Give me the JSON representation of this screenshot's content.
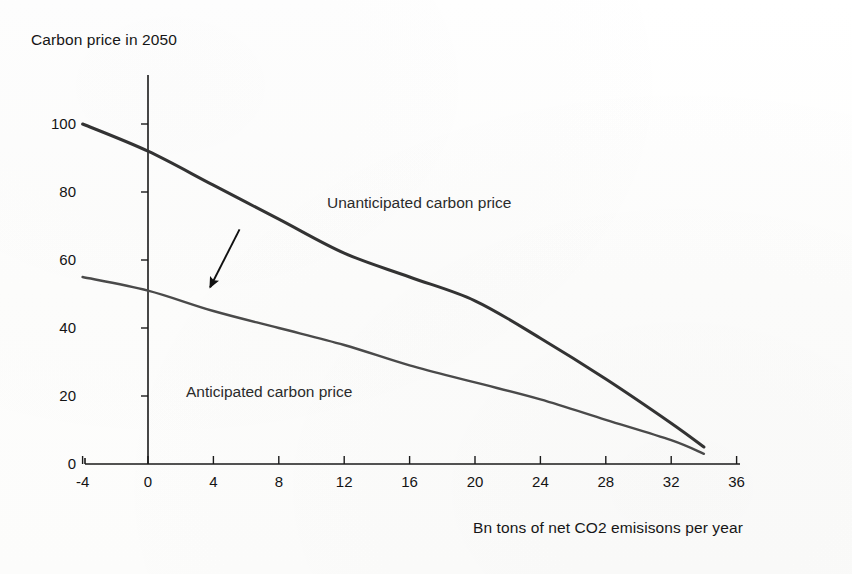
{
  "chart_data": {
    "type": "line",
    "title": "",
    "ylabel": "Carbon price in 2050",
    "xlabel": "Bn tons of net CO2 emisisons per year",
    "xlim": [
      -6,
      37
    ],
    "ylim": [
      0,
      108
    ],
    "xticks": [
      -4,
      0,
      4,
      8,
      12,
      16,
      20,
      24,
      28,
      32,
      36
    ],
    "xtick_labels": [
      "-4",
      "0",
      "4",
      "8",
      "12",
      "16",
      "20",
      "24",
      "28",
      "32",
      "36"
    ],
    "yticks": [
      0,
      20,
      40,
      60,
      80,
      100
    ],
    "ytick_labels": [
      "0",
      "20",
      "40",
      "60",
      "80",
      "100"
    ],
    "grid": false,
    "legend_position": "inline-annotations",
    "series": [
      {
        "name": "Unanticipated carbon price",
        "color": "#333333",
        "label_x": 10,
        "label_y": 77,
        "x": [
          -4,
          0,
          4,
          8,
          12,
          16,
          20,
          24,
          28,
          32,
          34
        ],
        "values": [
          100,
          92,
          82,
          72,
          62,
          55,
          48,
          37,
          25,
          12,
          5
        ]
      },
      {
        "name": "Anticipated carbon price",
        "color": "#4a4a4a",
        "label_x": 1,
        "label_y": 22,
        "x": [
          -4,
          0,
          4,
          8,
          12,
          16,
          20,
          24,
          28,
          32,
          34
        ],
        "values": [
          55,
          51,
          45,
          40,
          35,
          29,
          24,
          19,
          13,
          7,
          3
        ]
      }
    ],
    "annotations": [
      {
        "name": "downward-shift-arrow",
        "type": "arrow",
        "from_x": 5.6,
        "from_y": 69,
        "to_x": 3.8,
        "to_y": 52
      }
    ]
  },
  "axes": {
    "y_axis_title": "Carbon price in 2050",
    "x_axis_title": "Bn tons of net CO2 emisisons per year"
  },
  "labels": {
    "unanticipated": "Unanticipated carbon price",
    "anticipated": "Anticipated carbon price"
  },
  "ticks": {
    "x": [
      "-4",
      "0",
      "4",
      "8",
      "12",
      "16",
      "20",
      "24",
      "28",
      "32",
      "36"
    ],
    "y": [
      "100",
      "80",
      "60",
      "40",
      "20",
      "0"
    ]
  },
  "colors": {
    "unanticipated_line": "#333333",
    "anticipated_line": "#4a4a4a",
    "axis": "#1a1a1a",
    "background": "#fefefe"
  }
}
